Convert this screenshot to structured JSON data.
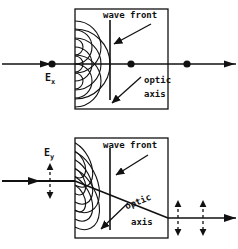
{
  "figure": {
    "stroke_color": "#111111",
    "background_color": "#ffffff"
  },
  "panels": [
    {
      "id": "top-panel",
      "name": "ordinary-ray-panel",
      "crystal_box": {
        "x": 75,
        "y": 9,
        "width": 93,
        "height": 100
      },
      "incident_label": "E",
      "incident_subscript": "x",
      "wave_front_label": "wave front",
      "optic_axis_label_line1": "optic",
      "optic_axis_label_line2": "axis",
      "polarization_marker": "dot",
      "ray_direction": "straight-through"
    },
    {
      "id": "bottom-panel",
      "name": "extraordinary-ray-panel",
      "crystal_box": {
        "x": 75,
        "y": 138,
        "width": 93,
        "height": 100
      },
      "incident_label": "E",
      "incident_subscript": "y",
      "wave_front_label": "wave front",
      "optic_axis_label_line1": "optic",
      "optic_axis_label_line2": "axis",
      "polarization_marker": "vertical-double-arrow",
      "ray_direction": "deviated-downward"
    }
  ]
}
